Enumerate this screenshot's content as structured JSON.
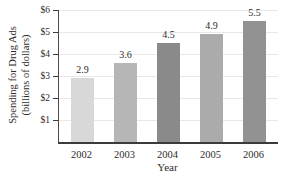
{
  "chart_data": {
    "type": "bar",
    "categories": [
      "2002",
      "2003",
      "2004",
      "2005",
      "2006"
    ],
    "values": [
      2.9,
      3.6,
      4.5,
      4.9,
      5.5
    ],
    "value_labels": [
      "2.9",
      "3.6",
      "4.5",
      "4.9",
      "5.5"
    ],
    "bar_colors": [
      "#d8d8d8",
      "#b6b6b6",
      "#8a8a8a",
      "#ababab",
      "#929292"
    ],
    "title": "",
    "xlabel": "Year",
    "ylabel_line1": "Spending for Drug Ads",
    "ylabel_line2": "(billions of dollars)",
    "y_tick_values": [
      1,
      2,
      3,
      4,
      5,
      6
    ],
    "y_tick_labels": [
      "$1",
      "$2",
      "$3",
      "$4",
      "$5",
      "$6"
    ],
    "ylim": [
      0,
      6
    ],
    "grid": true,
    "legend": "none",
    "colors": {
      "axis": "#3b3b3b",
      "grid": "#eae7e7",
      "text": "#2e2c2b",
      "background": "#ffffff"
    }
  }
}
